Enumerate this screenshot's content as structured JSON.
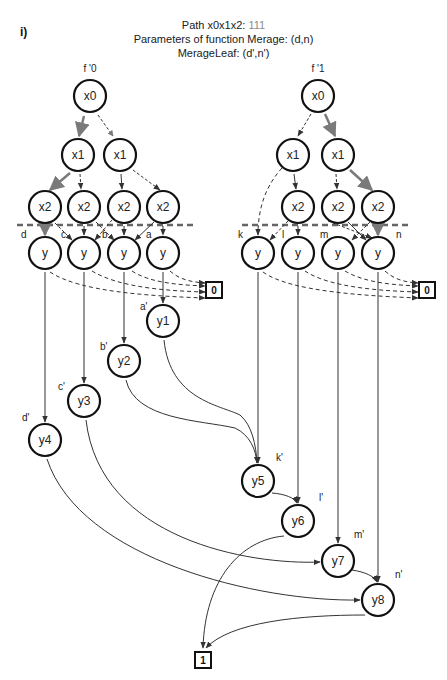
{
  "panel_label": "i)",
  "header": {
    "line1_prefix": "Path x0x1x2: ",
    "line1_value": "111",
    "line2": "Parameters of function Merage: (d,n)",
    "line3": "MerageLeaf: (d',n')"
  },
  "colors": {
    "node_stroke": "#111111",
    "edge": "#444444",
    "highlight_edge": "#7a7a7a",
    "divider": "#666666",
    "path_value": "#8a8a8a"
  },
  "trees": [
    {
      "id": "f0",
      "label": "f '0"
    },
    {
      "id": "f1",
      "label": "f '1"
    }
  ],
  "nodes": [
    {
      "id": "L_x0",
      "label": "x0",
      "x": 90,
      "y": 96
    },
    {
      "id": "L_x1a",
      "label": "x1",
      "x": 78,
      "y": 155
    },
    {
      "id": "L_x1b",
      "label": "x1",
      "x": 120,
      "y": 155
    },
    {
      "id": "L_x2a",
      "label": "x2",
      "x": 45,
      "y": 207
    },
    {
      "id": "L_x2b",
      "label": "x2",
      "x": 84,
      "y": 207
    },
    {
      "id": "L_x2c",
      "label": "x2",
      "x": 124,
      "y": 207
    },
    {
      "id": "L_x2d",
      "label": "x2",
      "x": 163,
      "y": 207
    },
    {
      "id": "L_yd",
      "label": "y",
      "x": 45,
      "y": 253,
      "tag": "d"
    },
    {
      "id": "L_yc",
      "label": "y",
      "x": 84,
      "y": 253,
      "tag": "c"
    },
    {
      "id": "L_yb",
      "label": "y",
      "x": 124,
      "y": 253,
      "tag": "b"
    },
    {
      "id": "L_ya",
      "label": "y",
      "x": 163,
      "y": 253,
      "tag": "a"
    },
    {
      "id": "R_x0",
      "label": "x0",
      "x": 318,
      "y": 96
    },
    {
      "id": "R_x1a",
      "label": "x1",
      "x": 293,
      "y": 155
    },
    {
      "id": "R_x1b",
      "label": "x1",
      "x": 338,
      "y": 155
    },
    {
      "id": "R_x2a",
      "label": "x2",
      "x": 298,
      "y": 207
    },
    {
      "id": "R_x2b",
      "label": "x2",
      "x": 338,
      "y": 207
    },
    {
      "id": "R_x2c",
      "label": "x2",
      "x": 378,
      "y": 207
    },
    {
      "id": "R_yk",
      "label": "y",
      "x": 258,
      "y": 253,
      "tag": "k"
    },
    {
      "id": "R_yl",
      "label": "y",
      "x": 298,
      "y": 253,
      "tag": "l"
    },
    {
      "id": "R_ym",
      "label": "y",
      "x": 338,
      "y": 253,
      "tag": "m"
    },
    {
      "id": "R_yn",
      "label": "y",
      "x": 378,
      "y": 253,
      "tag": "n"
    },
    {
      "id": "y1",
      "label": "y1",
      "x": 163,
      "y": 321,
      "tag": "a'"
    },
    {
      "id": "y2",
      "label": "y2",
      "x": 124,
      "y": 361,
      "tag": "b'"
    },
    {
      "id": "y3",
      "label": "y3",
      "x": 84,
      "y": 401,
      "tag": "c'"
    },
    {
      "id": "y4",
      "label": "y4",
      "x": 45,
      "y": 440,
      "tag": "d'"
    },
    {
      "id": "y5",
      "label": "y5",
      "x": 258,
      "y": 481,
      "tag": "k'"
    },
    {
      "id": "y6",
      "label": "y6",
      "x": 298,
      "y": 521,
      "tag": "l'"
    },
    {
      "id": "y7",
      "label": "y7",
      "x": 338,
      "y": 561,
      "tag": "m'"
    },
    {
      "id": "y8",
      "label": "y8",
      "x": 378,
      "y": 600,
      "tag": "n'"
    }
  ],
  "terminals": [
    {
      "id": "T0_left",
      "label": "0",
      "x": 214,
      "y": 290
    },
    {
      "id": "T0_right",
      "label": "0",
      "x": 427,
      "y": 290
    },
    {
      "id": "T1",
      "label": "1",
      "x": 203,
      "y": 660
    }
  ],
  "node_tags": [
    {
      "text": "d",
      "x": 21,
      "y": 238
    },
    {
      "text": "c",
      "x": 61,
      "y": 238
    },
    {
      "text": "b",
      "x": 102,
      "y": 238
    },
    {
      "text": "a",
      "x": 146,
      "y": 238
    },
    {
      "text": "k",
      "x": 238,
      "y": 238
    },
    {
      "text": "l",
      "x": 282,
      "y": 238
    },
    {
      "text": "m",
      "x": 320,
      "y": 238
    },
    {
      "text": "n",
      "x": 396,
      "y": 238
    },
    {
      "text": "a'",
      "x": 140,
      "y": 310
    },
    {
      "text": "b'",
      "x": 100,
      "y": 350
    },
    {
      "text": "c'",
      "x": 58,
      "y": 390
    },
    {
      "text": "d'",
      "x": 22,
      "y": 421
    },
    {
      "text": "k'",
      "x": 276,
      "y": 461
    },
    {
      "text": "l'",
      "x": 319,
      "y": 501
    },
    {
      "text": "m'",
      "x": 354,
      "y": 538
    },
    {
      "text": "n'",
      "x": 395,
      "y": 578
    }
  ],
  "divider_lines": [
    {
      "x1": 17,
      "x2": 195,
      "y": 225
    },
    {
      "x1": 242,
      "x2": 410,
      "y": 225
    }
  ]
}
